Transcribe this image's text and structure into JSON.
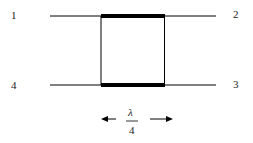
{
  "diagram": {
    "ports": [
      {
        "id": "p1",
        "label": "1"
      },
      {
        "id": "p2",
        "label": "2"
      },
      {
        "id": "p3",
        "label": "3"
      },
      {
        "id": "p4",
        "label": "4"
      }
    ],
    "length_label": {
      "numerator": "λ",
      "denominator": "4"
    },
    "colors": {
      "line": "#000000",
      "text": "#222222",
      "background": "#ffffff"
    }
  }
}
